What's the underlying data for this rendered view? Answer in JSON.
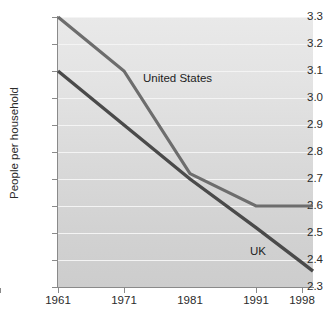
{
  "chart_data": {
    "type": "line",
    "title": "",
    "subtitle": "",
    "xlabel": "",
    "ylabel": "People per household",
    "x": [
      1961,
      1971,
      1981,
      1991,
      1998
    ],
    "xticklabels": [
      "1961",
      "1971",
      "1981",
      "1991",
      "1998"
    ],
    "ylim": [
      2.3,
      3.3
    ],
    "yticks": [
      2.3,
      2.4,
      2.5,
      2.6,
      2.7,
      2.8,
      2.9,
      3.0,
      3.1,
      3.2,
      3.3
    ],
    "yticklabels": [
      "2.3",
      "2.4",
      "2.5",
      "2.6",
      "2.7",
      "2.8",
      "2.9",
      "3.0",
      "3.1",
      "3.2",
      "3.3"
    ],
    "grid": "horizontal",
    "legend": "inline-annotations",
    "series": [
      {
        "name": "United States",
        "color": "#6d6d6d",
        "values": [
          3.3,
          3.1,
          2.72,
          2.6,
          2.6
        ],
        "label_text": "United States"
      },
      {
        "name": "UK",
        "color": "#4a4a4a",
        "values": [
          3.1,
          2.9,
          2.7,
          2.52,
          2.39
        ],
        "label_text": "UK"
      }
    ],
    "annotations": [
      {
        "text": "United States",
        "near_series": "United States"
      },
      {
        "text": "UK",
        "near_series": "UK"
      }
    ]
  },
  "axis": {
    "y_title": "People per household",
    "y_tick_labels": [
      "3.3",
      "3.2",
      "3.1",
      "3.0",
      "2.9",
      "2.8",
      "2.7",
      "2.6",
      "2.5",
      "2.4",
      "2.3"
    ],
    "x_tick_labels": [
      "1961",
      "1971",
      "1981",
      "1991",
      "1998"
    ]
  },
  "labels": {
    "united_states": "United States",
    "uk": "UK"
  },
  "colors": {
    "us_line": "#6d6d6d",
    "uk_line": "#4a4a4a",
    "plot_background": "#dcdcdc",
    "gridline": "#f4f4f4",
    "axis": "#8a8a8a",
    "text": "#2b2b2b"
  }
}
